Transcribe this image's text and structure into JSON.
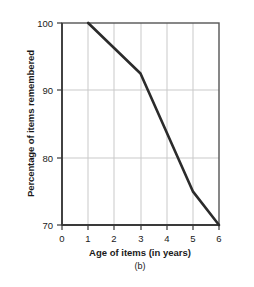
{
  "chart_data": {
    "type": "line",
    "title": "",
    "subtitle": "",
    "caption": "(b)",
    "xlabel": "Age of items (in years)",
    "ylabel": "Percentage of items remembered",
    "xlim": [
      0,
      6
    ],
    "ylim": [
      70,
      100
    ],
    "xticks": [
      "0",
      "1",
      "2",
      "3",
      "4",
      "5",
      "6"
    ],
    "xtick_values": [
      0,
      1,
      2,
      3,
      4,
      5,
      6
    ],
    "yticks": [
      "70",
      "80",
      "90",
      "100"
    ],
    "ytick_values": [
      70,
      80,
      90,
      100
    ],
    "grid": true,
    "grid_color": "#c9c9c9",
    "legend": null,
    "line_color": "#2b2b2b",
    "line_width": 2.6,
    "series": [
      {
        "name": "Percentage of items remembered",
        "x": [
          1,
          3,
          5,
          6
        ],
        "values": [
          100,
          92.5,
          75,
          70
        ]
      }
    ]
  },
  "axes": {
    "frame_color": "#555555",
    "background": "#ffffff"
  }
}
